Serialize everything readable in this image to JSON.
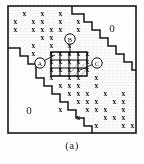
{
  "figure": {
    "caption": "(a)",
    "frame": {
      "x": 8,
      "y": 6,
      "w": 128,
      "h": 127,
      "stroke": "#1b1b1b",
      "stroke_width": 1.6
    },
    "background": "#ffffff",
    "ink_color": "#121212",
    "stipple_color": "#9a9a9a"
  },
  "zero_labels": [
    {
      "id": "zero-top-right",
      "text": "0",
      "x": 112,
      "y": 32
    },
    {
      "id": "zero-bottom-left",
      "text": "0",
      "x": 29,
      "y": 114
    }
  ],
  "point_labels": [
    {
      "id": "label-a",
      "text": "A",
      "cx": 40,
      "cy": 63,
      "r": 5.2,
      "leader": [
        [
          44.5,
          60.5
        ],
        [
          55,
          55
        ]
      ]
    },
    {
      "id": "label-b",
      "text": "B",
      "cx": 70,
      "cy": 39,
      "r": 5.2,
      "leader": [
        [
          70,
          44.5
        ],
        [
          70,
          55
        ]
      ]
    },
    {
      "id": "label-c",
      "text": "C",
      "cx": 97,
      "cy": 63,
      "r": 5.2,
      "leader": [
        [
          92.5,
          64.5
        ],
        [
          80,
          70
        ]
      ]
    }
  ],
  "highlight_box": {
    "id": "highlight-block",
    "x": 51,
    "y": 52,
    "w": 36,
    "h": 24,
    "cols": 4,
    "rows": 3,
    "stroke": "#101010",
    "stroke_width": 1.5,
    "hatch": {
      "from_x": 69,
      "from_y": 64,
      "to_x": 87,
      "to_y": 76
    }
  },
  "band": {
    "description": "stippled diagonal band between two staircase boundaries",
    "upper_staircase": [
      [
        8,
        6
      ],
      [
        72,
        6
      ],
      [
        72,
        14
      ],
      [
        84,
        14
      ],
      [
        84,
        22
      ],
      [
        92,
        22
      ],
      [
        92,
        30
      ],
      [
        100,
        30
      ],
      [
        100,
        38
      ],
      [
        108,
        38
      ],
      [
        108,
        46
      ],
      [
        116,
        46
      ],
      [
        116,
        54
      ],
      [
        124,
        54
      ],
      [
        124,
        62
      ],
      [
        132,
        62
      ],
      [
        132,
        70
      ],
      [
        136,
        70
      ]
    ],
    "lower_staircase": [
      [
        8,
        48
      ],
      [
        20,
        48
      ],
      [
        20,
        56
      ],
      [
        28,
        56
      ],
      [
        28,
        64
      ],
      [
        36,
        64
      ],
      [
        36,
        78
      ],
      [
        44,
        78
      ],
      [
        44,
        86
      ],
      [
        52,
        86
      ],
      [
        52,
        94
      ],
      [
        60,
        94
      ],
      [
        60,
        102
      ],
      [
        68,
        102
      ],
      [
        68,
        110
      ],
      [
        76,
        110
      ],
      [
        76,
        118
      ],
      [
        84,
        118
      ],
      [
        84,
        126
      ],
      [
        92,
        126
      ],
      [
        92,
        133
      ]
    ]
  },
  "grid": {
    "origin_x": 11,
    "origin_y": 9,
    "cell_w": 9,
    "cell_h": 8,
    "cols": 14,
    "rows": 15,
    "marker": "x",
    "marks": [
      {
        "r": 0,
        "c": [
          1,
          3,
          5
        ]
      },
      {
        "r": 1,
        "c": [
          0,
          2,
          3,
          5,
          7
        ]
      },
      {
        "r": 2,
        "c": [
          0,
          2,
          3,
          4,
          5,
          7
        ]
      },
      {
        "r": 3,
        "c": [
          3,
          4,
          6
        ]
      },
      {
        "r": 4,
        "c": [
          2,
          4,
          6
        ]
      },
      {
        "r": 5,
        "c": [
          2,
          4,
          5,
          6,
          7,
          8
        ]
      },
      {
        "r": 6,
        "c": [
          4,
          5,
          6,
          7,
          8
        ]
      },
      {
        "r": 7,
        "c": [
          4,
          5,
          6,
          7,
          8
        ]
      },
      {
        "r": 8,
        "c": [
          4,
          6,
          7,
          9
        ]
      },
      {
        "r": 9,
        "c": [
          5,
          6,
          7,
          9
        ]
      },
      {
        "r": 10,
        "c": [
          6,
          7,
          8,
          10,
          12
        ]
      },
      {
        "r": 11,
        "c": [
          7,
          8,
          9,
          11,
          12
        ]
      },
      {
        "r": 12,
        "c": [
          5,
          8,
          9,
          10,
          12
        ]
      },
      {
        "r": 13,
        "c": [
          7,
          10,
          11,
          12
        ]
      },
      {
        "r": 14,
        "c": [
          9,
          12,
          13
        ]
      }
    ]
  },
  "chart_data": {
    "type": "heatmap",
    "title": "(a)",
    "xlabel": "",
    "ylabel": "",
    "rows": 15,
    "cols": 14,
    "legend": [
      "x = nonzero entry",
      "0 = zero block"
    ],
    "annotations": [
      "A",
      "B",
      "C",
      "0",
      "0"
    ],
    "values": [
      [
        0,
        1,
        0,
        1,
        0,
        1,
        0,
        0,
        0,
        0,
        0,
        0,
        0,
        0
      ],
      [
        1,
        0,
        1,
        1,
        0,
        1,
        0,
        1,
        0,
        0,
        0,
        0,
        0,
        0
      ],
      [
        1,
        0,
        1,
        1,
        1,
        1,
        0,
        1,
        0,
        0,
        0,
        0,
        0,
        0
      ],
      [
        0,
        0,
        0,
        1,
        1,
        0,
        1,
        0,
        0,
        0,
        0,
        0,
        0,
        0
      ],
      [
        0,
        0,
        1,
        0,
        1,
        0,
        1,
        0,
        0,
        0,
        0,
        0,
        0,
        0
      ],
      [
        0,
        0,
        1,
        0,
        1,
        1,
        1,
        1,
        1,
        0,
        0,
        0,
        0,
        0
      ],
      [
        0,
        0,
        0,
        0,
        1,
        1,
        1,
        1,
        1,
        0,
        0,
        0,
        0,
        0
      ],
      [
        0,
        0,
        0,
        0,
        1,
        1,
        1,
        1,
        1,
        0,
        0,
        0,
        0,
        0
      ],
      [
        0,
        0,
        0,
        0,
        1,
        0,
        1,
        1,
        0,
        1,
        0,
        0,
        0,
        0
      ],
      [
        0,
        0,
        0,
        0,
        0,
        1,
        1,
        1,
        0,
        1,
        0,
        0,
        0,
        0
      ],
      [
        0,
        0,
        0,
        0,
        0,
        0,
        1,
        1,
        1,
        0,
        1,
        0,
        1,
        0
      ],
      [
        0,
        0,
        0,
        0,
        0,
        0,
        0,
        1,
        1,
        1,
        0,
        1,
        1,
        0
      ],
      [
        0,
        0,
        0,
        0,
        0,
        1,
        0,
        0,
        1,
        1,
        1,
        0,
        1,
        0
      ],
      [
        0,
        0,
        0,
        0,
        0,
        0,
        0,
        1,
        0,
        0,
        1,
        1,
        1,
        0
      ],
      [
        0,
        0,
        0,
        0,
        0,
        0,
        0,
        0,
        0,
        1,
        0,
        0,
        1,
        1
      ]
    ]
  }
}
